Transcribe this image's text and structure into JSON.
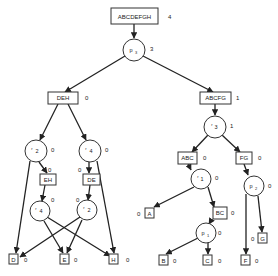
{
  "diagram": {
    "type": "tree",
    "root": {
      "id": "ABCDEFGH",
      "label": "ABCDEFGH",
      "value": "4"
    },
    "nodes": {
      "p3": {
        "label": "p",
        "sub": "3",
        "value": "3"
      },
      "DEH": {
        "label": "DEH",
        "value": "0"
      },
      "ABCFG": {
        "label": "ABCFG",
        "value": "1"
      },
      "r2a": {
        "label": "r",
        "sub": "2",
        "value": "0"
      },
      "r4a": {
        "label": "r",
        "sub": "4",
        "value": "0"
      },
      "EH": {
        "label": "EH",
        "value": "0"
      },
      "DE": {
        "label": "DE",
        "value": "0"
      },
      "r4b": {
        "label": "r",
        "sub": "4",
        "value": "0"
      },
      "r2b": {
        "label": "r",
        "sub": "2",
        "value": "0"
      },
      "D": {
        "label": "D",
        "value": "0"
      },
      "E": {
        "label": "E",
        "value": "0"
      },
      "H": {
        "label": "H",
        "value": "0"
      },
      "r3": {
        "label": "r",
        "sub": "3",
        "value": "1"
      },
      "ABC": {
        "label": "ABC",
        "value": "0"
      },
      "FG": {
        "label": "FG",
        "value": "0"
      },
      "r1": {
        "label": "r",
        "sub": "1",
        "value": "0"
      },
      "p2": {
        "label": "p",
        "sub": "2",
        "value": "0"
      },
      "A": {
        "label": "A",
        "value": "0"
      },
      "BC": {
        "label": "BC",
        "value": "0"
      },
      "p1": {
        "label": "p",
        "sub": "1",
        "value": "0"
      },
      "G": {
        "label": "G",
        "value": "0"
      },
      "B": {
        "label": "B",
        "value": "0"
      },
      "C": {
        "label": "C",
        "value": "0"
      },
      "F": {
        "label": "F",
        "value": "0"
      }
    },
    "edges": [
      [
        "ABCDEFGH",
        "p3"
      ],
      [
        "p3",
        "DEH"
      ],
      [
        "p3",
        "ABCFG"
      ],
      [
        "DEH",
        "r2a"
      ],
      [
        "DEH",
        "r4a"
      ],
      [
        "r2a",
        "EH"
      ],
      [
        "r2a",
        "D"
      ],
      [
        "r4a",
        "DE"
      ],
      [
        "r4a",
        "H"
      ],
      [
        "EH",
        "r4b"
      ],
      [
        "DE",
        "r2b"
      ],
      [
        "r4b",
        "E"
      ],
      [
        "r4b",
        "H"
      ],
      [
        "r2b",
        "D"
      ],
      [
        "r2b",
        "E"
      ],
      [
        "ABCFG",
        "r3"
      ],
      [
        "r3",
        "ABC"
      ],
      [
        "r3",
        "FG"
      ],
      [
        "ABC",
        "r1"
      ],
      [
        "r1",
        "A"
      ],
      [
        "r1",
        "BC"
      ],
      [
        "BC",
        "p1"
      ],
      [
        "p1",
        "B"
      ],
      [
        "p1",
        "C"
      ],
      [
        "FG",
        "p2"
      ],
      [
        "p2",
        "F"
      ],
      [
        "p2",
        "G"
      ]
    ]
  }
}
